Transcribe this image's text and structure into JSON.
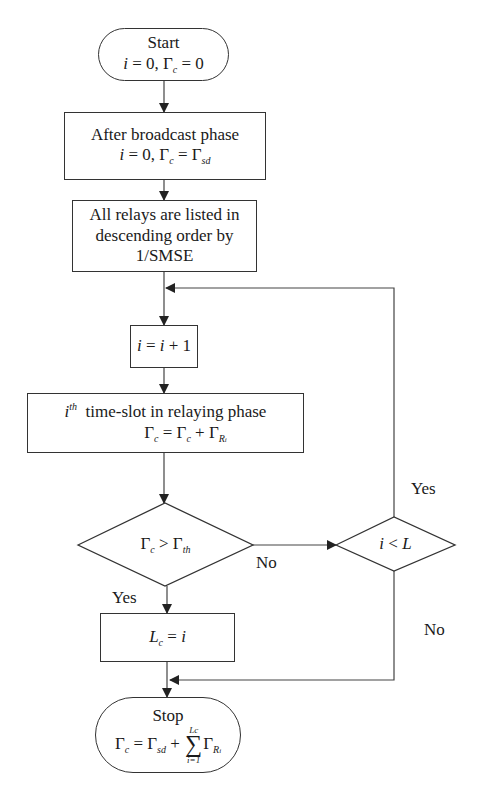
{
  "flowchart": {
    "start": {
      "title": "Start",
      "formula": {
        "i": "i",
        "eq1": " = 0, ",
        "gamma": "Γ",
        "sub": "c",
        "eq2": " = 0"
      }
    },
    "broadcast": {
      "title": "After broadcast phase",
      "formula": {
        "i": "i",
        "eq1": " = 0, ",
        "gamma": "Γ",
        "sub": "c",
        "eq2": " = Γ",
        "sub2": "sd"
      }
    },
    "sort": {
      "line1": "All relays are  listed in",
      "line2": "descending order by",
      "line3": "1/SMSE"
    },
    "increment": {
      "i1": "i",
      "eq": " = ",
      "i2": "i",
      "plus": " + 1"
    },
    "relay_slot": {
      "sup_i": "i",
      "sup_th": "th",
      "title": "time-slot in relaying phase",
      "formula": {
        "g1": "Γ",
        "s1": "c",
        "eq": " = Γ",
        "s2": "c",
        "plus": " + Γ",
        "s3": "R",
        "s3b": "i"
      }
    },
    "decision_threshold": {
      "g1": "Γ",
      "s1": "c",
      "op": " > Γ",
      "s2": "th"
    },
    "decision_count": {
      "i": "i",
      "op": " < ",
      "L": "L"
    },
    "assign": {
      "L": "L",
      "sub": "c",
      "eq": " = ",
      "i": "i"
    },
    "stop": {
      "title": "Stop",
      "formula": {
        "g1": "Γ",
        "s1": "c",
        "eq": " = Γ",
        "s2": "sd",
        "plus": " + ",
        "sum_upper": "Lc",
        "sum_sigma": "∑",
        "sum_lower": "i=1",
        "g2": "Γ",
        "s3": "R",
        "s3b": "i"
      }
    },
    "edge_labels": {
      "threshold_no": "No",
      "threshold_yes": "Yes",
      "count_yes": "Yes",
      "count_no": "No"
    }
  },
  "colors": {
    "stroke": "#333333",
    "background": "#ffffff",
    "text": "#1a1a1a"
  }
}
